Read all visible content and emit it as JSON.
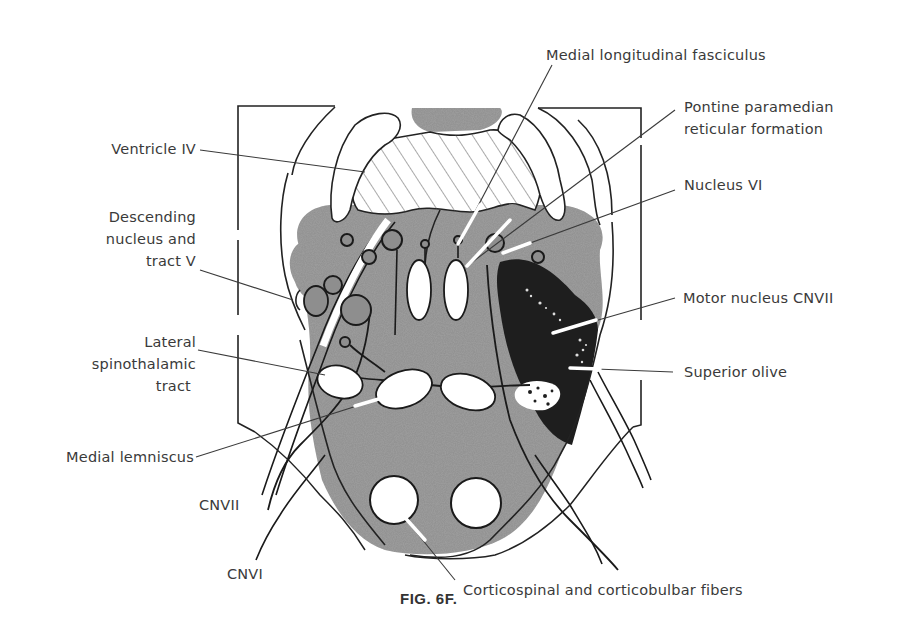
{
  "figure": {
    "caption": "FIG. 6F.",
    "colors": {
      "background": "#ffffff",
      "tissue_gray": "#8e8e8e",
      "dark_region": "#1e1e1e",
      "outline": "#1a1a1a",
      "label_text": "#3a3a3a"
    }
  },
  "labels": {
    "left": [
      {
        "id": "ventricle-iv",
        "text": "Ventricle IV"
      },
      {
        "id": "descending-nucleus",
        "lines": [
          "Descending",
          "nucleus and",
          "tract V"
        ]
      },
      {
        "id": "lateral-spinothalamic",
        "lines": [
          "Lateral",
          "spinothalamic",
          "tract"
        ]
      },
      {
        "id": "medial-lemniscus",
        "text": "Medial lemniscus"
      }
    ],
    "right": [
      {
        "id": "mlf",
        "text": "Medial longitudinal fasciculus"
      },
      {
        "id": "pprf",
        "lines": [
          "Pontine paramedian",
          "reticular formation"
        ]
      },
      {
        "id": "nucleus-vi",
        "text": "Nucleus VI"
      },
      {
        "id": "motor-nucleus-cnvii",
        "text": "Motor nucleus CNVII"
      },
      {
        "id": "superior-olive",
        "text": "Superior olive"
      }
    ],
    "bottom": [
      {
        "id": "cnvii",
        "text": "CNVII"
      },
      {
        "id": "cnvi",
        "text": "CNVI"
      },
      {
        "id": "corticospinal",
        "text": "Corticospinal and corticobulbar fibers"
      }
    ]
  }
}
